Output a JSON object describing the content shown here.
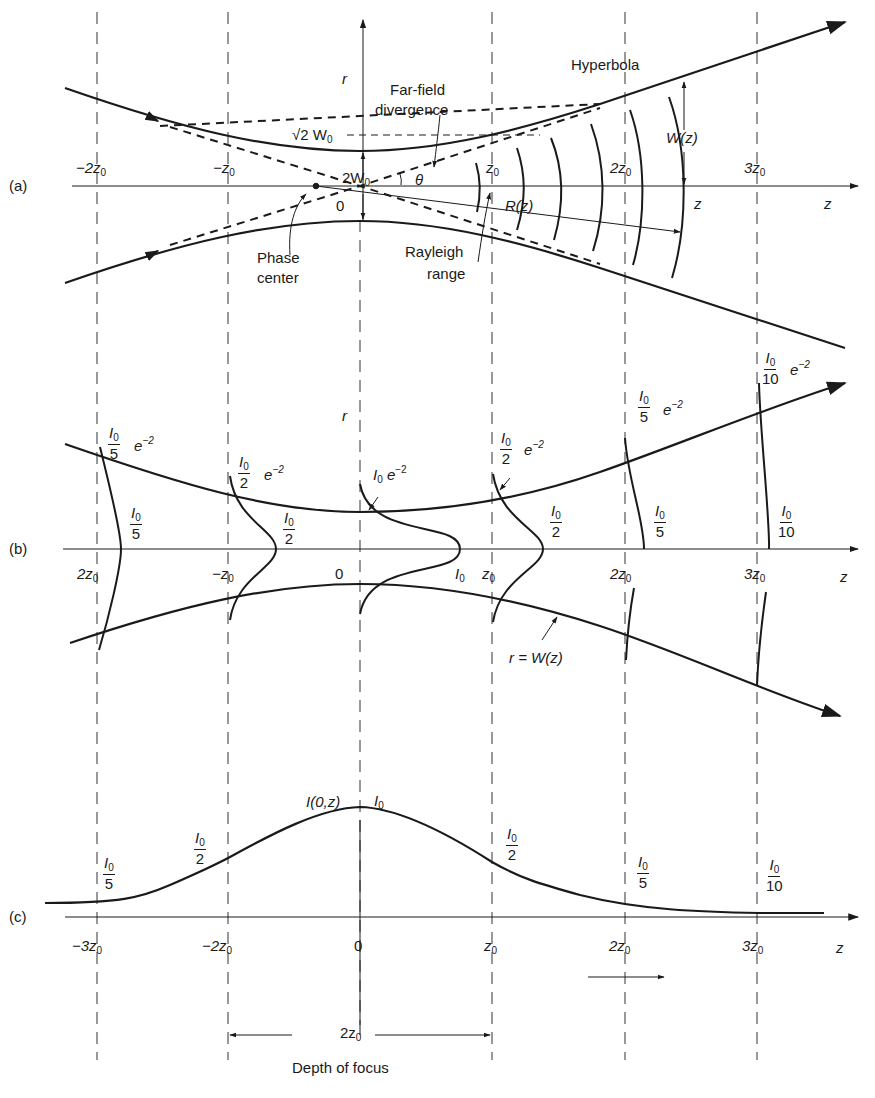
{
  "panels": {
    "a": {
      "label": "(a)",
      "axis_r": "r",
      "axis_z": "z",
      "z_at_curve": "z",
      "ticks": [
        "−2z",
        "−z",
        "z",
        "2z",
        "3z"
      ],
      "tick_sub": "0",
      "origin": "0",
      "sqrt2_w0": "√2 W",
      "two_w0": "2W",
      "w_sub": "0",
      "theta": "θ",
      "hyperbola": "Hyperbola",
      "far_field": [
        "Far-field",
        "divergence"
      ],
      "phase_center": [
        "Phase",
        "center"
      ],
      "rayleigh": [
        "Rayleigh",
        "range"
      ],
      "R": "R(z)",
      "W": "W(z)"
    },
    "b": {
      "label": "(b)",
      "axis_r": "r",
      "axis_z": "z",
      "ticks": [
        "2z",
        "−z",
        "z",
        "2z",
        "3z"
      ],
      "tick_sub": "0",
      "origin": "0",
      "I": "I",
      "I_sub": "0",
      "e": "e",
      "exp": "−2",
      "den": [
        "5",
        "2",
        "2",
        "5",
        "10"
      ],
      "I0": "I",
      "rW": "r = W(z)"
    },
    "c": {
      "label": "(c)",
      "axis_z": "z",
      "axis_title": "I(0,z)",
      "ticks": [
        "−3z",
        "−2z",
        "0",
        "z",
        "2z",
        "3z"
      ],
      "tick_sub": "0",
      "peak": "I",
      "den": [
        "5",
        "2",
        "2",
        "5",
        "10"
      ],
      "depth_value": "2z",
      "depth_label": "Depth of focus"
    }
  },
  "colors": {
    "ink": "#1a1a1a",
    "guide": "#333333",
    "background": "#ffffff"
  }
}
